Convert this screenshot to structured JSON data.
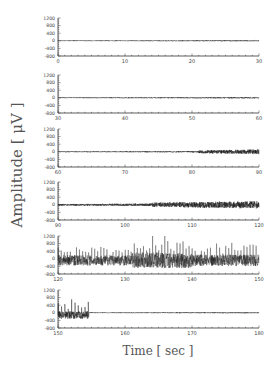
{
  "chart_data": {
    "type": "line",
    "title": "",
    "xlabel": "Time [ sec ]",
    "ylabel": "Amplitude [ μV ]",
    "ylim": [
      -800,
      1200
    ],
    "yticks": [
      1200,
      800,
      400,
      0,
      -400,
      -800
    ],
    "grid": false,
    "legend": null,
    "panels": [
      {
        "xlim": [
          0,
          30
        ],
        "xticks": [
          0,
          10,
          20,
          30
        ],
        "description": "near-flat baseline, low noise",
        "envelope": [
          [
            0,
            30,
            25,
            0
          ]
        ]
      },
      {
        "xlim": [
          30,
          60
        ],
        "xticks": [
          30,
          40,
          50,
          60
        ],
        "description": "near-flat baseline, low noise",
        "envelope": [
          [
            30,
            60,
            30,
            0
          ]
        ]
      },
      {
        "xlim": [
          60,
          90
        ],
        "xticks": [
          60,
          70,
          80,
          90
        ],
        "description": "flat with small bursts, noise increases after ~81 s",
        "envelope": [
          [
            60,
            81,
            30,
            0
          ],
          [
            81,
            90,
            130,
            0
          ]
        ]
      },
      {
        "xlim": [
          90,
          120
        ],
        "xticks": [
          90,
          100,
          110,
          120
        ],
        "description": "noise gradually increasing toward 120 s",
        "envelope": [
          [
            90,
            104,
            70,
            0
          ],
          [
            104,
            120,
            200,
            0
          ]
        ]
      },
      {
        "xlim": [
          120,
          150
        ],
        "xticks": [
          120,
          130,
          140,
          150
        ],
        "description": "large-amplitude oscillations, peaks up to ~1200 μV near 132-136 s",
        "envelope": [
          [
            120,
            131,
            500,
            1
          ],
          [
            131,
            140,
            750,
            1
          ],
          [
            140,
            150,
            550,
            1
          ]
        ]
      },
      {
        "xlim": [
          150,
          180
        ],
        "xticks": [
          150,
          160,
          170,
          180
        ],
        "description": "decaying spikes until ~154.5 s then flat baseline",
        "envelope": [
          [
            150,
            154.6,
            650,
            2
          ],
          [
            154.6,
            180,
            25,
            0
          ]
        ]
      }
    ]
  },
  "labels": {
    "y_axis": "Amplitude [ μV ]",
    "x_axis": "Time [ sec ]"
  },
  "style": {
    "line_color": "#111111",
    "axis_color": "#333333",
    "tick_label_color": "#444444",
    "axis_label_color": "#555555"
  }
}
